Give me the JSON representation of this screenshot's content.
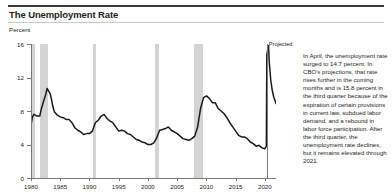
{
  "figure": {
    "title": "The Unemployment Rate",
    "axis_unit_label": "Percent",
    "projected_label": "Projected",
    "note": "In April, the unemployment rate surged to 14.7 percent. In CBO's projections, that rate rises further in the coming months and is 15.8 percent in the third quarter because of the expiration of certain provisions in current law, subdued labor demand, and a rebound in labor force participation. After the third quarter, the unemployment rate declines, but it remains elevated through 2021."
  },
  "colors": {
    "line": "#1a1a1a",
    "recession_band": "#d4d4d4",
    "axis": "#7a7a7a",
    "rule": "#3a3a3a",
    "text": "#231f20"
  },
  "chart_data": {
    "type": "line",
    "title": "The Unemployment Rate",
    "xlabel": "",
    "ylabel": "Percent",
    "xlim": [
      1980,
      2021.9
    ],
    "ylim": [
      0,
      16
    ],
    "yticks": [
      0,
      4,
      8,
      12,
      16
    ],
    "xticks": [
      1980,
      1985,
      1990,
      1995,
      2000,
      2005,
      2010,
      2015,
      2020
    ],
    "grid": false,
    "legend": false,
    "projection_start": 2020.33,
    "annotations": [
      {
        "text": "Projected",
        "x": 2020.33,
        "y": 16
      }
    ],
    "recessions": [
      {
        "start": 1980.0,
        "end": 1980.6
      },
      {
        "start": 1981.55,
        "end": 1982.9
      },
      {
        "start": 1990.6,
        "end": 1991.2
      },
      {
        "start": 2001.2,
        "end": 2001.9
      },
      {
        "start": 2007.95,
        "end": 2009.5
      }
    ],
    "series": [
      {
        "name": "Unemployment rate (historical)",
        "x": [
          1980.0,
          1980.25,
          1980.5,
          1980.75,
          1981.0,
          1981.25,
          1981.5,
          1981.75,
          1982.0,
          1982.25,
          1982.5,
          1982.75,
          1983.0,
          1983.25,
          1983.5,
          1983.75,
          1984.0,
          1984.5,
          1985.0,
          1985.5,
          1986.0,
          1986.5,
          1987.0,
          1987.5,
          1988.0,
          1988.5,
          1989.0,
          1989.5,
          1990.0,
          1990.5,
          1991.0,
          1991.5,
          1992.0,
          1992.5,
          1993.0,
          1993.5,
          1994.0,
          1994.5,
          1995.0,
          1995.5,
          1996.0,
          1996.5,
          1997.0,
          1997.5,
          1998.0,
          1998.5,
          1999.0,
          1999.5,
          2000.0,
          2000.5,
          2001.0,
          2001.5,
          2002.0,
          2002.5,
          2003.0,
          2003.5,
          2004.0,
          2004.5,
          2005.0,
          2005.5,
          2006.0,
          2006.5,
          2007.0,
          2007.5,
          2008.0,
          2008.5,
          2009.0,
          2009.5,
          2010.0,
          2010.5,
          2011.0,
          2011.5,
          2012.0,
          2012.5,
          2013.0,
          2013.5,
          2014.0,
          2014.5,
          2015.0,
          2015.5,
          2016.0,
          2016.5,
          2017.0,
          2017.5,
          2018.0,
          2018.5,
          2019.0,
          2019.5,
          2020.0,
          2020.25,
          2020.33
        ],
        "values": [
          6.3,
          7.3,
          7.6,
          7.5,
          7.4,
          7.4,
          7.4,
          8.2,
          8.8,
          9.4,
          9.9,
          10.7,
          10.4,
          10.1,
          9.4,
          8.5,
          7.9,
          7.5,
          7.3,
          7.2,
          7.0,
          7.0,
          6.6,
          6.0,
          5.7,
          5.5,
          5.2,
          5.3,
          5.3,
          5.6,
          6.6,
          6.9,
          7.4,
          7.6,
          7.1,
          6.8,
          6.6,
          6.1,
          5.6,
          5.7,
          5.6,
          5.3,
          5.2,
          4.9,
          4.6,
          4.5,
          4.3,
          4.2,
          4.0,
          4.0,
          4.2,
          4.8,
          5.7,
          5.8,
          5.9,
          6.1,
          5.7,
          5.5,
          5.3,
          5.0,
          4.7,
          4.6,
          4.5,
          4.7,
          5.0,
          6.1,
          8.3,
          9.6,
          9.8,
          9.5,
          9.0,
          9.0,
          8.3,
          8.0,
          7.7,
          7.2,
          6.6,
          6.1,
          5.6,
          5.1,
          4.9,
          4.9,
          4.7,
          4.3,
          4.1,
          3.8,
          3.9,
          3.6,
          3.5,
          3.8,
          14.7
        ]
      },
      {
        "name": "Unemployment rate (projected)",
        "x": [
          2020.33,
          2020.5,
          2020.62,
          2020.75,
          2021.0,
          2021.25,
          2021.5,
          2021.75,
          2021.9
        ],
        "values": [
          14.7,
          15.4,
          15.8,
          13.8,
          11.7,
          10.5,
          9.7,
          9.2,
          8.9
        ]
      }
    ]
  }
}
